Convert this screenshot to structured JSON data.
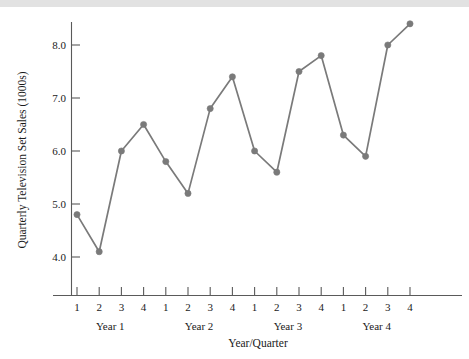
{
  "figure": {
    "background_color": "#ffffff",
    "top_band_color": "#e2e2e2",
    "axis_color": "#5a5a5a"
  },
  "chart_data": {
    "type": "line",
    "title": "",
    "subtitle": "",
    "xlabel": "Year/Quarter",
    "ylabel": "Quarterly Television Set Sales (1000s)",
    "series_color": "#7a7a7a",
    "marker": "circle",
    "grid": false,
    "legend": "none",
    "ylim": [
      3.5,
      8.7
    ],
    "yticks": [
      4.0,
      5.0,
      6.0,
      7.0,
      8.0
    ],
    "ytick_labels": [
      "4.0",
      "5.0",
      "6.0",
      "7.0",
      "8.0"
    ],
    "x": [
      1,
      2,
      3,
      4,
      5,
      6,
      7,
      8,
      9,
      10,
      11,
      12,
      13,
      14,
      15,
      16
    ],
    "categories": [
      "1",
      "2",
      "3",
      "4",
      "1",
      "2",
      "3",
      "4",
      "1",
      "2",
      "3",
      "4",
      "1",
      "2",
      "3",
      "4"
    ],
    "values": [
      4.8,
      4.1,
      6.0,
      6.5,
      5.8,
      5.2,
      6.8,
      7.4,
      6.0,
      5.6,
      7.5,
      7.8,
      6.3,
      5.9,
      8.0,
      8.4
    ],
    "group_labels": [
      "Year 1",
      "Year 2",
      "Year 3",
      "Year 4"
    ],
    "group_size": 4,
    "points": [
      {
        "year": 1,
        "quarter": 1,
        "value": 4.8
      },
      {
        "year": 1,
        "quarter": 2,
        "value": 4.1
      },
      {
        "year": 1,
        "quarter": 3,
        "value": 6.0
      },
      {
        "year": 1,
        "quarter": 4,
        "value": 6.5
      },
      {
        "year": 2,
        "quarter": 1,
        "value": 5.8
      },
      {
        "year": 2,
        "quarter": 2,
        "value": 5.2
      },
      {
        "year": 2,
        "quarter": 3,
        "value": 6.8
      },
      {
        "year": 2,
        "quarter": 4,
        "value": 7.4
      },
      {
        "year": 3,
        "quarter": 1,
        "value": 6.0
      },
      {
        "year": 3,
        "quarter": 2,
        "value": 5.6
      },
      {
        "year": 3,
        "quarter": 3,
        "value": 7.5
      },
      {
        "year": 3,
        "quarter": 4,
        "value": 7.8
      },
      {
        "year": 4,
        "quarter": 1,
        "value": 6.3
      },
      {
        "year": 4,
        "quarter": 2,
        "value": 5.9
      },
      {
        "year": 4,
        "quarter": 3,
        "value": 8.0
      },
      {
        "year": 4,
        "quarter": 4,
        "value": 8.4
      }
    ]
  }
}
